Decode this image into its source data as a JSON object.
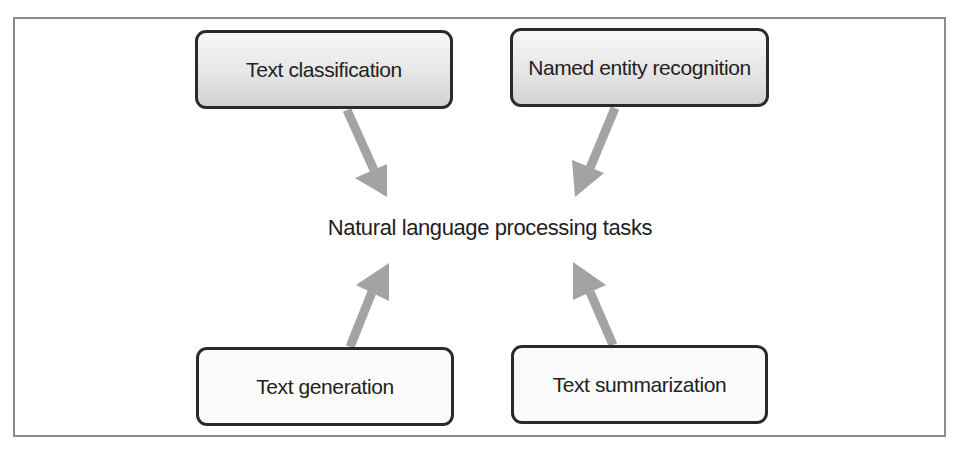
{
  "diagram": {
    "center": {
      "label": "Natural language processing tasks"
    },
    "nodes": [
      {
        "id": "text-classification",
        "label": "Text classification",
        "position": "top-left",
        "style": "shaded"
      },
      {
        "id": "named-entity-recognition",
        "label": "Named entity recognition",
        "position": "top-right",
        "style": "shaded"
      },
      {
        "id": "text-generation",
        "label": "Text generation",
        "position": "bottom-left",
        "style": "plain"
      },
      {
        "id": "text-summarization",
        "label": "Text summarization",
        "position": "bottom-right",
        "style": "plain"
      }
    ],
    "edges": [
      {
        "from": "text-classification",
        "to": "center"
      },
      {
        "from": "named-entity-recognition",
        "to": "center"
      },
      {
        "from": "text-generation",
        "to": "center"
      },
      {
        "from": "text-summarization",
        "to": "center"
      }
    ],
    "colors": {
      "arrow": "#a3a3a3",
      "box_border": "#2a2a2a",
      "frame_border": "#8a8a8a",
      "shaded_top": "#f7f7f7",
      "shaded_bottom": "#d2d2d2"
    }
  }
}
